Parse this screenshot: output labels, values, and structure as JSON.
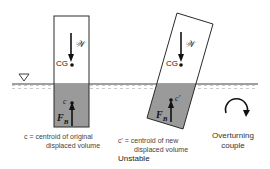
{
  "diagram": {
    "title": "Unstable",
    "colors": {
      "water": "#9a9a9a",
      "water_surface_hatch": "#b8b8b8",
      "outline": "#2a2a2a",
      "background": "#ffffff",
      "text": "#333333"
    },
    "water_level_symbol": "▽",
    "left_body": {
      "weight_label": "𝒲",
      "cg_label": "CG",
      "centroid_label": "c",
      "buoyancy_label": "F",
      "buoyancy_sub": "B",
      "caption_line1": "c = centroid of original",
      "caption_line2": "displaced volume"
    },
    "right_body": {
      "weight_label": "𝒲",
      "cg_label": "CG",
      "centroid_label": "c'",
      "buoyancy_label": "F",
      "buoyancy_sub": "B",
      "caption_line1": "c' = centroid of new",
      "caption_line2": "displaced volume"
    },
    "couple": {
      "caption_line1": "Overturning",
      "caption_line2": "couple"
    }
  }
}
